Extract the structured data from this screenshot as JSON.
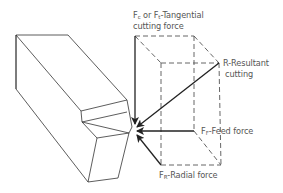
{
  "diagram": {
    "labels": {
      "tangential_line1_a": "F",
      "tangential_sub_c": "c",
      "tangential_or": " or F",
      "tangential_sub_t": "t",
      "tangential_rest": "-Tangential",
      "tangential_line2": "cutting force",
      "resultant_line1": "R-Resultant",
      "resultant_line2": "cutting",
      "feed_f": "F",
      "feed_sub": "F",
      "feed_rest": "-Feed force",
      "radial_f": "F",
      "radial_sub": "R",
      "radial_rest": "-Radial force"
    },
    "components": [
      "cutting-tool",
      "force-box",
      "tangential-force-arrow",
      "resultant-force-arrow",
      "feed-force-arrow",
      "radial-force-arrow"
    ],
    "colors": {
      "line": "#222222",
      "dashed": "#555555",
      "text": "#555555"
    }
  }
}
